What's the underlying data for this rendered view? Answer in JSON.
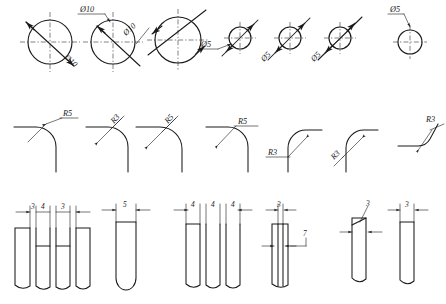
{
  "drawing": {
    "title": "Engineering Dimensioning Examples",
    "sheet_width": 446,
    "sheet_height": 304,
    "line_color": "#1a1a1a",
    "background_color": "#ffffff",
    "row_count": 3
  },
  "rows": [
    {
      "name": "diameter-dimensioning-row",
      "label": "Diameter dimensions on circles",
      "items": [
        {
          "id": "d1",
          "text": "Ø10",
          "style": "rotated-inside-diagonal",
          "cx": 50,
          "cy": 42,
          "r": 22
        },
        {
          "id": "d2",
          "text": "Ø10",
          "style": "horizontal-leader-above",
          "cx": 113,
          "cy": 42,
          "r": 22
        },
        {
          "id": "d3",
          "text": "Ø10",
          "style": "rotated-outside-diagonal",
          "cx": 178,
          "cy": 40,
          "r": 23
        },
        {
          "id": "d4",
          "text": "Ø5",
          "style": "horizontal-leader-left",
          "cx": 240,
          "cy": 38,
          "r": 11
        },
        {
          "id": "d5",
          "text": "Ø5",
          "style": "rotated-outside-lower-left",
          "cx": 290,
          "cy": 38,
          "r": 11
        },
        {
          "id": "d6",
          "text": "Ø5",
          "style": "rotated-outside-lower-left",
          "cx": 340,
          "cy": 38,
          "r": 11
        },
        {
          "id": "d7",
          "text": "Ø5",
          "style": "horizontal-leader-above",
          "cx": 410,
          "cy": 42,
          "r": 12
        }
      ]
    },
    {
      "name": "radius-dimensioning-row",
      "label": "Radius dimensions on fillets",
      "items": [
        {
          "id": "r1",
          "text": "R5",
          "style": "leader-horizontal-text"
        },
        {
          "id": "r2",
          "text": "R3",
          "style": "leader-rotated-text"
        },
        {
          "id": "r3",
          "text": "R5",
          "style": "leader-rotated-text"
        },
        {
          "id": "r4",
          "text": "R5",
          "style": "leader-horizontal-text"
        },
        {
          "id": "r5",
          "text": "R3",
          "style": "leader-left-horizontal"
        },
        {
          "id": "r6",
          "text": "R3",
          "style": "leader-rotated-text"
        },
        {
          "id": "r7",
          "text": "R3",
          "style": "leader-upper-right"
        }
      ]
    },
    {
      "name": "linear-dimensioning-row",
      "label": "Linear dimensions on slots and grooves",
      "items": [
        {
          "id": "l1",
          "dims": [
            "3",
            "4",
            "3"
          ],
          "style": "three-slot-group"
        },
        {
          "id": "l2",
          "dims": [
            "5"
          ],
          "style": "single-round-bottom-slot"
        },
        {
          "id": "l3",
          "dims": [
            "4",
            "4",
            "4"
          ],
          "style": "three-slot-equal"
        },
        {
          "id": "l4",
          "dims": [
            "3",
            "7"
          ],
          "style": "slot-with-width-and-depth"
        },
        {
          "id": "l5",
          "dims": [
            "3"
          ],
          "style": "narrow-slot-leader"
        },
        {
          "id": "l6",
          "dims": [
            "3"
          ],
          "style": "narrow-slot-top-dim"
        }
      ]
    }
  ],
  "labels": {
    "dia10": "Ø10",
    "dia5": "Ø5",
    "r5": "R5",
    "r3": "R3",
    "n3": "3",
    "n4": "4",
    "n5": "5",
    "n7": "7"
  }
}
